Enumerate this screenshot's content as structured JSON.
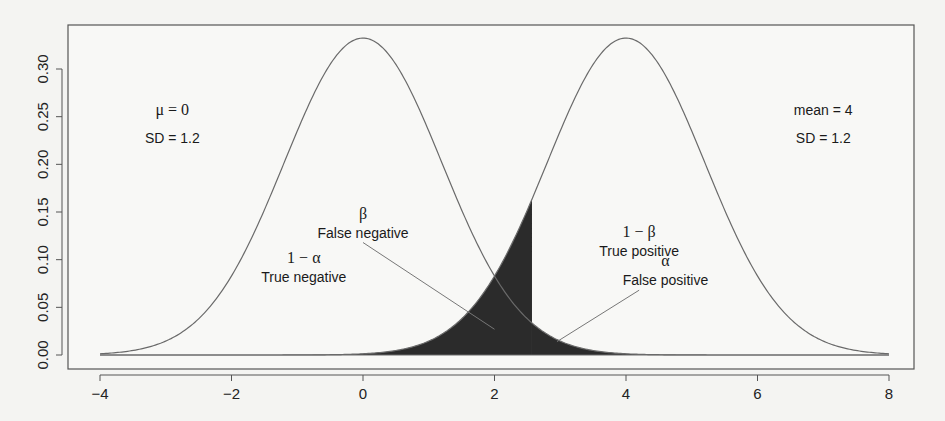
{
  "chart_data": {
    "type": "line",
    "title": "",
    "xlabel": "",
    "ylabel": "",
    "xlim": [
      -4,
      8
    ],
    "ylim": [
      0,
      0.33
    ],
    "grid": false,
    "x_ticks": [
      "-4",
      "-2",
      "0",
      "2",
      "4",
      "6",
      "8"
    ],
    "x_tick_values": [
      -4,
      -2,
      0,
      2,
      4,
      6,
      8
    ],
    "y_ticks": [
      "0.00",
      "0.05",
      "0.10",
      "0.15",
      "0.20",
      "0.25",
      "0.30"
    ],
    "y_tick_values": [
      0,
      0.05,
      0.1,
      0.15,
      0.2,
      0.25,
      0.3
    ],
    "series": [
      {
        "name": "null distribution",
        "distribution": "normal",
        "mean": 0,
        "sd": 1.2,
        "x_range": [
          -4,
          8
        ]
      },
      {
        "name": "alternative distribution",
        "distribution": "normal",
        "mean": 4,
        "sd": 1.2,
        "x_range": [
          -4,
          8
        ]
      }
    ],
    "critical_value": 2.57,
    "shaded_regions": [
      {
        "name": "beta",
        "under": "alternative distribution",
        "from": -4,
        "to": 2.57,
        "color": "#2b2b2b"
      },
      {
        "name": "alpha",
        "under": "null distribution",
        "from": 2.57,
        "to": 8,
        "color": "#2b2b2b"
      }
    ],
    "annotations": [
      {
        "id": "null_mean",
        "text": "μ = 0",
        "x": -2.9,
        "y": 0.252
      },
      {
        "id": "null_sd",
        "text": "SD = 1.2",
        "x": -2.9,
        "y": 0.222
      },
      {
        "id": "alt_mean",
        "text": "mean = 4",
        "x": 7.0,
        "y": 0.252
      },
      {
        "id": "alt_sd",
        "text": "SD = 1.2",
        "x": 7.0,
        "y": 0.222
      },
      {
        "id": "beta_symbol",
        "text": "β",
        "x": 0.0,
        "y": 0.143
      },
      {
        "id": "beta_label",
        "text": "False negative",
        "x": 0.0,
        "y": 0.123
      },
      {
        "id": "one_minus_alpha_symbol",
        "text": "1 − α",
        "x": -0.9,
        "y": 0.097
      },
      {
        "id": "one_minus_alpha_label",
        "text": "True negative",
        "x": -0.9,
        "y": 0.077
      },
      {
        "id": "one_minus_beta_symbol",
        "text": "1 − β",
        "x": 4.2,
        "y": 0.124
      },
      {
        "id": "one_minus_beta_label",
        "text": "True positive",
        "x": 4.2,
        "y": 0.104
      },
      {
        "id": "alpha_symbol",
        "text": "α",
        "x": 4.6,
        "y": 0.093
      },
      {
        "id": "alpha_label",
        "text": "False positive",
        "x": 4.6,
        "y": 0.073
      }
    ],
    "pointer_lines": [
      {
        "from": [
          0.0,
          0.118
        ],
        "to": [
          2.0,
          0.027
        ]
      },
      {
        "from": [
          4.2,
          0.068
        ],
        "to": [
          2.95,
          0.014
        ]
      }
    ]
  }
}
